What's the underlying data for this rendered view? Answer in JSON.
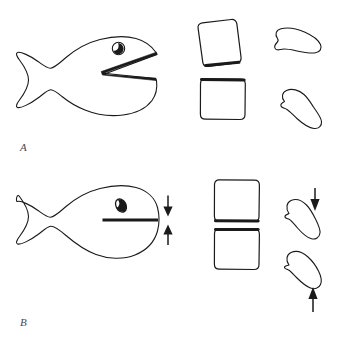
{
  "figure": {
    "background_color": "#ffffff",
    "stroke_color": "#1a1a1a",
    "width": 341,
    "height": 344
  },
  "panels": [
    {
      "id": "A",
      "label": "A",
      "label_position": {
        "x": 20,
        "y": 141
      },
      "description": "open-mouth fish with tilted square, upright square and two blobs",
      "items": [
        {
          "name": "fish",
          "state": "mouth-open",
          "eye": {
            "shape": "circle",
            "pupil": "filled-crescent"
          },
          "mouth": {
            "shape": "wedge",
            "angle_deg": 28,
            "open": true
          }
        },
        {
          "name": "square-top",
          "orientation": "tilted",
          "rotation_deg": -8,
          "emphasized_edge": "bottom"
        },
        {
          "name": "square-bottom",
          "orientation": "upright",
          "rotation_deg": 0,
          "emphasized_edge": "top"
        },
        {
          "name": "blob-top",
          "orientation": "concave-down"
        },
        {
          "name": "blob-bottom",
          "orientation": "concave-left"
        }
      ],
      "arrows": []
    },
    {
      "id": "B",
      "label": "B",
      "label_position": {
        "x": 20,
        "y": 316
      },
      "description": "closed-mouth fish with convergence arrows, two aligned squares and two blobs with arrows",
      "items": [
        {
          "name": "fish",
          "state": "mouth-closed",
          "eye": {
            "shape": "tilted-ellipse",
            "pupil": "half-filled"
          },
          "mouth": {
            "shape": "bar",
            "angle_deg": 0,
            "open": false
          }
        },
        {
          "name": "square-top",
          "orientation": "upright",
          "rotation_deg": 0,
          "emphasized_edge": "bottom"
        },
        {
          "name": "square-bottom",
          "orientation": "upright",
          "rotation_deg": 0,
          "emphasized_edge": "top"
        },
        {
          "name": "blob-top",
          "orientation": "concave-down"
        },
        {
          "name": "blob-bottom",
          "orientation": "concave-left"
        }
      ],
      "arrows": [
        {
          "name": "arrow-fish-down",
          "direction": "down",
          "target": "fish-mouth"
        },
        {
          "name": "arrow-fish-up",
          "direction": "up",
          "target": "fish-mouth"
        },
        {
          "name": "arrow-blob-down",
          "direction": "down",
          "target": "blob-top"
        },
        {
          "name": "arrow-blob-up",
          "direction": "up",
          "target": "blob-bottom"
        }
      ]
    }
  ]
}
